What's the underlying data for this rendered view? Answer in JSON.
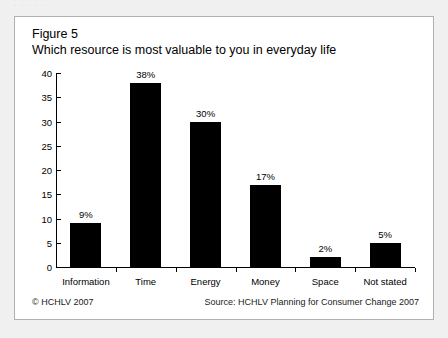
{
  "page": {
    "top_bleed_text": "· · · · ·"
  },
  "figure": {
    "number_label": "Figure 5",
    "title": "Which resource is most valuable to you in everyday life"
  },
  "footer": {
    "copyright": "© HCHLV 2007",
    "source": "Source: HCHLV Planning for Consumer Change 2007"
  },
  "chart_data": {
    "type": "bar",
    "title": "Which resource is most valuable to you in everyday life",
    "subtitle": "Figure 5",
    "xlabel": "",
    "ylabel": "",
    "ylim": [
      0,
      40
    ],
    "ytick_step": 5,
    "yticks": [
      0,
      5,
      10,
      15,
      20,
      25,
      30,
      35,
      40
    ],
    "ytick_labels": [
      "0",
      "5",
      "10",
      "15",
      "20",
      "25",
      "30",
      "35",
      "40"
    ],
    "grid": false,
    "legend": false,
    "bar_color": "#000000",
    "categories": [
      "Information",
      "Time",
      "Energy",
      "Money",
      "Space",
      "Not stated"
    ],
    "values": [
      9,
      38,
      30,
      17,
      2,
      5
    ],
    "data_labels": [
      "9%",
      "38%",
      "30%",
      "17%",
      "2%",
      "5%"
    ]
  }
}
